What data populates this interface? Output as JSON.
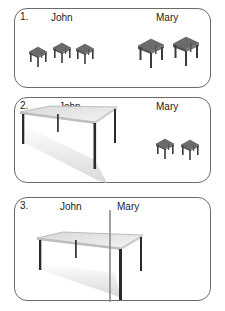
{
  "panels": [
    {
      "number": "1.",
      "labels": {
        "left": "John",
        "right": "Mary"
      },
      "description": "John has three small tables; Mary has two slightly larger tables."
    },
    {
      "number": "2.",
      "labels": {
        "left": "John",
        "right": "Mary"
      },
      "description": "John has one large table; Mary has two small tables."
    },
    {
      "number": "3.",
      "labels": {
        "left": "John",
        "right": "Mary"
      },
      "description": "One large table split by a vertical line between John and Mary."
    }
  ],
  "colors": {
    "panel_border": "#6a6a6a",
    "small_table_top": "#6b6b6b",
    "large_table_top": "#e8e8e8",
    "table_leg": "#2a2a2a",
    "divider": "#8a8a8a"
  }
}
